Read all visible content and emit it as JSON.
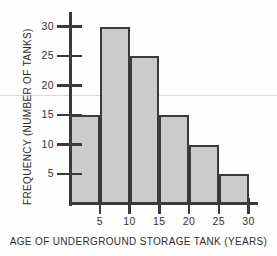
{
  "chart_data": {
    "type": "bar",
    "title": "",
    "xlabel": "AGE OF UNDERGROUND STORAGE TANK (YEARS)",
    "ylabel": "FREQUENCY (NUMBER OF TANKS)",
    "categories": [
      "0-5",
      "5-10",
      "10-15",
      "15-20",
      "20-25",
      "25-30"
    ],
    "values": [
      15,
      30,
      25,
      15,
      10,
      5
    ],
    "bin_edges": [
      0,
      5,
      10,
      15,
      20,
      25,
      30
    ],
    "bin_width": 5,
    "xlim": [
      0,
      32
    ],
    "ylim": [
      0,
      32
    ],
    "xticks": [
      5,
      10,
      15,
      20,
      25,
      30
    ],
    "yticks": [
      5,
      10,
      15,
      20,
      25,
      30
    ],
    "xtick_labels": [
      "5",
      "10",
      "15",
      "20",
      "25",
      "30"
    ],
    "ytick_labels": [
      "5",
      "10",
      "15",
      "20",
      "25",
      "30"
    ],
    "grid": false,
    "legend": false,
    "bar_fill_color": "#cbcbcb",
    "bar_edge_color": "#3a3a3a",
    "axis_color": "#3a3a3a",
    "background_color": "#fefefe"
  }
}
